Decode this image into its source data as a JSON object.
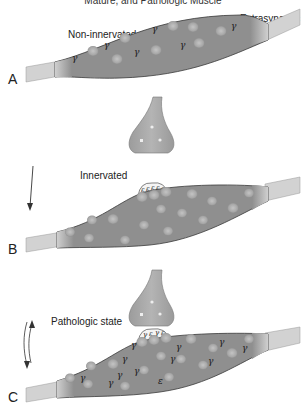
{
  "title": "Mature, and Pathologic Muscle",
  "colors": {
    "fiber": "#8e8e8e",
    "fiber_edge": "#3a3a3a",
    "tendon": "#cfcfcf",
    "nucleus": "#a9a9a9",
    "nerve": "#a6a6a6"
  },
  "panels": [
    {
      "letter": "A",
      "caption": "Non-innervated",
      "callout": "Extrasynaptic\nnuclei",
      "callout_line1": "Extrasynaptic",
      "callout_line2": "nuclei",
      "receptor_symbol": "γ",
      "arrow": "none"
    },
    {
      "letter": "B",
      "caption": "Innervated",
      "junction_receptors": [
        "ε",
        "ε",
        "ε",
        "ε",
        "ε"
      ],
      "arrow": "down"
    },
    {
      "letter": "C",
      "caption": "Pathologic state",
      "junction_receptors": [
        "γ",
        "ε",
        "γ",
        "ε"
      ],
      "receptor_symbols": [
        "γ",
        "ε"
      ],
      "arrow": "bidirectional"
    }
  ]
}
